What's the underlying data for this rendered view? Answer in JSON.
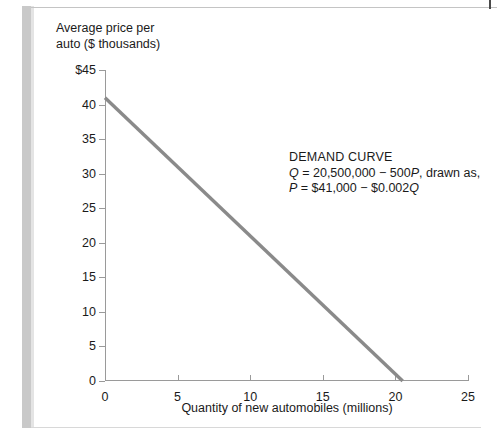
{
  "chart_data": {
    "type": "line",
    "title": "",
    "xlabel": "Quantity of new automobiles (millions)",
    "ylabel": "Average price per auto ($ thousands)",
    "xlim": [
      0,
      25
    ],
    "ylim": [
      0,
      45
    ],
    "xticks": [
      "0",
      "5",
      "10",
      "15",
      "20",
      "25"
    ],
    "xtick_values": [
      0,
      5,
      10,
      15,
      20,
      25
    ],
    "yticks": [
      "0",
      "5",
      "10",
      "15",
      "20",
      "25",
      "30",
      "35",
      "40",
      "$45"
    ],
    "ytick_values": [
      0,
      5,
      10,
      15,
      20,
      25,
      30,
      35,
      40,
      45
    ],
    "grid": false,
    "legend": "none",
    "series": [
      {
        "name": "Demand curve",
        "color": "#8a8a8a",
        "x": [
          0,
          20.5
        ],
        "y": [
          41,
          0
        ]
      }
    ],
    "annotations": [
      {
        "name": "demand-curve-note",
        "heading": "DEMAND CURVE",
        "equation_1": "Q = 20,500,000 − 500P, drawn as,",
        "equation_2": "P = $41,000 − $0.002Q",
        "equation_1_parts": {
          "var_a": "Q",
          "mid": " = 20,500,000 − 500",
          "var_b": "P",
          "tail": ", drawn as,"
        },
        "equation_2_parts": {
          "var_a": "P",
          "mid": " = $41,000 − $0.002",
          "var_b": "Q"
        }
      }
    ]
  },
  "axes": {
    "y_title_line1": "Average price per",
    "y_title_line2": "auto ($ thousands)",
    "x_title": "Quantity of new automobiles (millions)"
  },
  "colors": {
    "curve": "#8a8a8a",
    "axis": "#9a9a9a",
    "text": "#1a1a1a",
    "scan_bar": "#c9c9c9"
  }
}
